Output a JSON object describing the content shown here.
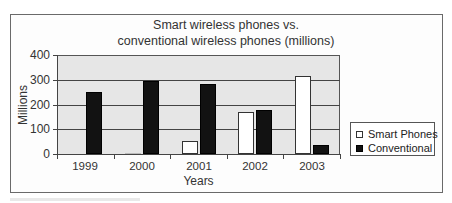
{
  "chart_data": {
    "type": "bar",
    "title": "Smart wireless phones vs. conventional wireless phones (millions)",
    "title_lines": [
      "Smart wireless phones vs.",
      "conventional wireless phones (millions)"
    ],
    "xlabel": "Years",
    "ylabel": "Millions",
    "categories": [
      "1999",
      "2000",
      "2001",
      "2002",
      "2003"
    ],
    "series": [
      {
        "name": "Smart Phones",
        "color": "#ffffff",
        "values": [
          0,
          4,
          53,
          170,
          317
        ]
      },
      {
        "name": "Conventional",
        "color": "#121212",
        "values": [
          252,
          295,
          283,
          177,
          36
        ]
      }
    ],
    "ylim": [
      0,
      400
    ],
    "yticks": [
      0,
      100,
      200,
      300,
      400
    ],
    "grid": true,
    "legend_position": "right",
    "plot_background": "#e6e6e6"
  }
}
